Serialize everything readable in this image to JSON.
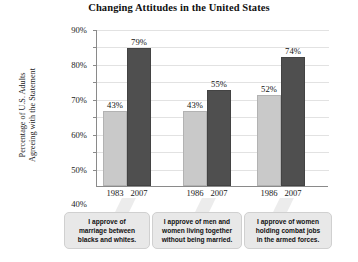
{
  "chart_data": {
    "type": "bar",
    "title": "Changing Attitudes in the United States",
    "xlabel": "",
    "ylabel": "Percentage of U.S. Adults\nAgreeing with the Statement",
    "ylim": [
      0,
      90
    ],
    "ytick_labels": [
      "90%",
      "80%",
      "70%",
      "60%",
      "50%",
      "40%",
      "30%",
      "20%",
      "10%"
    ],
    "ytick_values": [
      90,
      80,
      70,
      60,
      50,
      40,
      30,
      20,
      10
    ],
    "grid": true,
    "legend": "none",
    "colors": {
      "earlier_year_bar": "#c9c9c9",
      "year_2007_bar": "#4f4f4f",
      "gridline": "#e2e2e2",
      "axis": "#8a8a8a",
      "callout_background": "#e8e8e8"
    },
    "groups": [
      {
        "caption": "I approve of\nmarriage between\nblacks and whites.",
        "bars": [
          {
            "category": "1983",
            "value": 43,
            "label": "43%",
            "shade": "light"
          },
          {
            "category": "2007",
            "value": 79,
            "label": "79%",
            "shade": "dark"
          }
        ]
      },
      {
        "caption": "I approve of men and\nwomen living together\nwithout being married.",
        "bars": [
          {
            "category": "1986",
            "value": 43,
            "label": "43%",
            "shade": "light"
          },
          {
            "category": "2007",
            "value": 55,
            "label": "55%",
            "shade": "dark"
          }
        ]
      },
      {
        "caption": "I approve of women\nholding combat jobs\nin the armed forces.",
        "bars": [
          {
            "category": "1986",
            "value": 52,
            "label": "52%",
            "shade": "light"
          },
          {
            "category": "2007",
            "value": 74,
            "label": "74%",
            "shade": "dark"
          }
        ]
      }
    ]
  },
  "layout": {
    "plot": {
      "left": 96,
      "top": 30,
      "width": 232,
      "height": 157
    },
    "bar_width": 24,
    "group_starts": [
      6,
      86,
      160
    ],
    "bar_gap": 0,
    "callouts": [
      {
        "left": 64,
        "width": 86
      },
      {
        "left": 152,
        "width": 90
      },
      {
        "left": 244,
        "width": 88
      }
    ]
  }
}
